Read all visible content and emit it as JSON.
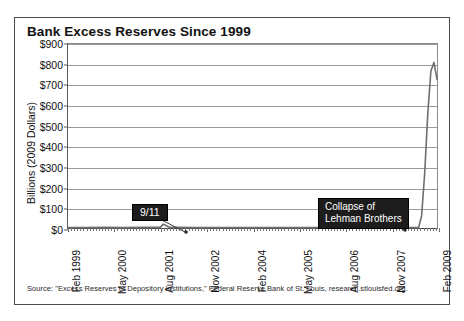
{
  "figure": {
    "title": "Bank Excess Reserves Since 1999",
    "source_note": "Source: \"Excess Reserves of Depository Institutions,\" Federal Reserve Bank of St. Louis, research.stlouisfed.org."
  },
  "annotations": {
    "sept11": "9/11",
    "lehman_line1": "Collapse of",
    "lehman_line2": "Lehman Brothers"
  },
  "chart_data": {
    "type": "line",
    "title": "Bank Excess Reserves Since 1999",
    "xlabel": "",
    "ylabel": "Billions (2009 Dollars)",
    "ylim": [
      0,
      900
    ],
    "ytick_labels": [
      "$900",
      "$800",
      "$700",
      "$600",
      "$500",
      "$400",
      "$300",
      "$200",
      "$100",
      "$0"
    ],
    "ytick_values": [
      900,
      800,
      700,
      600,
      500,
      400,
      300,
      200,
      100,
      0
    ],
    "grid": true,
    "legend": false,
    "xtick_labels": [
      "Feb 1999",
      "May 2000",
      "Aug 2001",
      "Nov 2002",
      "Feb 2004",
      "May 2005",
      "Aug 2006",
      "Nov 2007",
      "Feb 2009"
    ],
    "series": [
      {
        "name": "Excess Reserves",
        "color": "#6e6e6e",
        "x": [
          "Feb 1999",
          "Aug 1999",
          "Feb 2000",
          "Aug 2000",
          "Feb 2001",
          "Aug 2001",
          "Sep 2001",
          "Nov 2001",
          "Feb 2002",
          "Aug 2002",
          "Feb 2003",
          "Aug 2003",
          "Feb 2004",
          "Aug 2004",
          "Feb 2005",
          "Aug 2005",
          "Feb 2006",
          "Aug 2006",
          "Feb 2007",
          "Aug 2007",
          "Feb 2008",
          "Aug 2008",
          "Sep 2008",
          "Oct 2008",
          "Nov 2008",
          "Dec 2008",
          "Jan 2009",
          "Feb 2009"
        ],
        "values": [
          2,
          2,
          3,
          2,
          3,
          3,
          19,
          4,
          3,
          2,
          2,
          2,
          2,
          2,
          2,
          2,
          2,
          2,
          2,
          2,
          2,
          2,
          60,
          268,
          559,
          767,
          810,
          727
        ]
      }
    ],
    "annotations": [
      {
        "label": "9/11",
        "x": "Aug 2001",
        "y": 19
      },
      {
        "label": "Collapse of Lehman Brothers",
        "x": "Sep 2008",
        "y": 60
      }
    ]
  }
}
